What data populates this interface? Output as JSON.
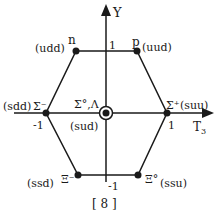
{
  "diagram": {
    "title": "[ 8 ]",
    "axes": {
      "y_label": "Y",
      "x_label_main": "T",
      "x_label_sub": "3",
      "tick_y_pos": "1",
      "tick_y_neg": "-1",
      "tick_x_pos": "1",
      "tick_x_neg": "-1"
    },
    "particles": [
      {
        "symbol": "n",
        "quarks": "(udd)"
      },
      {
        "symbol": "p",
        "quarks": "(uud)"
      },
      {
        "symbol": "Σ⁻",
        "quarks": "(sdd)"
      },
      {
        "symbol": "Σ⁺",
        "quarks": "(suu)"
      },
      {
        "symbol": "Σ°,Λ",
        "quarks": "(sud)"
      },
      {
        "symbol": "Ξ⁻",
        "quarks": "(ssd)"
      },
      {
        "symbol": "Ξ°",
        "quarks": "(ssu)"
      }
    ],
    "colors": {
      "ink": "#1a1a1a",
      "background": "#ffffff"
    }
  }
}
